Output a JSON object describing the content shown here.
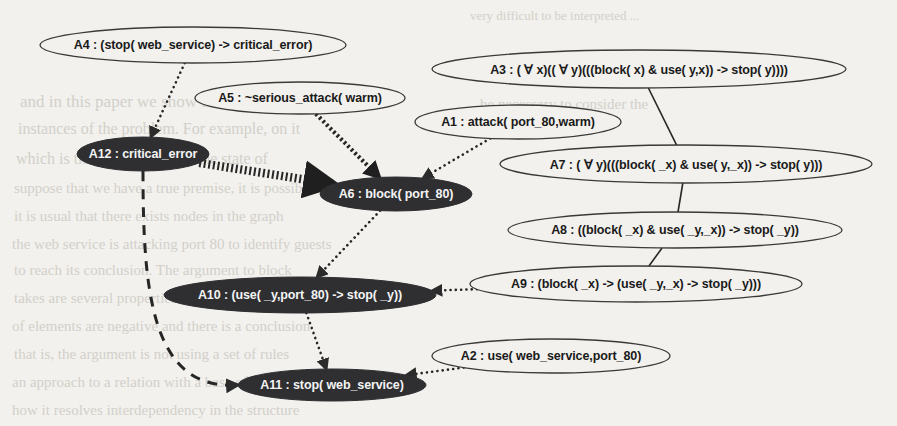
{
  "figure": {
    "kind": "argumentation-graph",
    "background_color": "#f2f1ed",
    "node_fill_light": "#f2f1ed",
    "node_fill_dark": "#2f2f32",
    "node_stroke": "#3a3a3a",
    "label_color_light": "#1a1a1a",
    "label_color_dark": "#f4f4f4"
  },
  "nodes": [
    {
      "id": "A4",
      "label": "A4 : (stop( web_service) -> critical_error)",
      "style": "light",
      "cx": 193,
      "cy": 45,
      "rx": 153,
      "ry": 18,
      "font": 12.5
    },
    {
      "id": "A5",
      "label": "A5 : ~serious_attack( warm)",
      "style": "light",
      "cx": 300,
      "cy": 98,
      "rx": 105,
      "ry": 16,
      "font": 12.5
    },
    {
      "id": "A3",
      "label": "A3 : ( ∀ x)(( ∀ y)(((block( x) & use( y,x)) -> stop( y))))",
      "style": "light",
      "cx": 639,
      "cy": 69,
      "rx": 207,
      "ry": 19,
      "font": 12.5
    },
    {
      "id": "A1",
      "label": "A1 : attack( port_80,warm)",
      "style": "light",
      "cx": 518,
      "cy": 122,
      "rx": 103,
      "ry": 17,
      "font": 12.5
    },
    {
      "id": "A7",
      "label": "A7 : ( ∀ y)(((block( _x) & use( y,_x)) -> stop( y)))",
      "style": "light",
      "cx": 686,
      "cy": 164,
      "rx": 186,
      "ry": 19,
      "font": 12.5
    },
    {
      "id": "A12",
      "label": "A12 : critical_error",
      "style": "dark",
      "cx": 143,
      "cy": 154,
      "rx": 66,
      "ry": 17,
      "font": 12.5
    },
    {
      "id": "A6",
      "label": "A6 : block( port_80)",
      "style": "dark",
      "cx": 396,
      "cy": 194,
      "rx": 76,
      "ry": 17,
      "font": 12.5
    },
    {
      "id": "A8",
      "label": "A8 : ((block( _x) & use( _y,_x)) -> stop( _y))",
      "style": "light",
      "cx": 675,
      "cy": 230,
      "rx": 167,
      "ry": 18,
      "font": 12.5
    },
    {
      "id": "A9",
      "label": "A9 : (block( _x) -> (use( _y,_x) -> stop( _y)))",
      "style": "light",
      "cx": 636,
      "cy": 284,
      "rx": 166,
      "ry": 18,
      "font": 12.5
    },
    {
      "id": "A10",
      "label": "A10 : (use( _y,port_80) -> stop( _y))",
      "style": "dark",
      "cx": 300,
      "cy": 295,
      "rx": 136,
      "ry": 18,
      "font": 12.5
    },
    {
      "id": "A2",
      "label": "A2 : use( web_service,port_80)",
      "style": "light",
      "cx": 551,
      "cy": 356,
      "rx": 119,
      "ry": 17,
      "font": 12.5
    },
    {
      "id": "A11",
      "label": "A11 : stop( web_service)",
      "style": "dark",
      "cx": 332,
      "cy": 385,
      "rx": 94,
      "ry": 16,
      "font": 12.5
    }
  ],
  "edges": [
    {
      "id": "A4-A12",
      "from": "A4",
      "to": "A12",
      "style": "dotted",
      "arrow": true
    },
    {
      "id": "A5-A6",
      "from": "A5",
      "to": "A6",
      "style": "thick-dotted",
      "arrow": true
    },
    {
      "id": "A1-A6",
      "from": "A1",
      "to": "A6",
      "style": "dotted",
      "arrow": true
    },
    {
      "id": "A12-A6",
      "from": "A12",
      "to": "A6",
      "style": "ladder",
      "arrow": true
    },
    {
      "id": "A3-A7",
      "from": "A3",
      "to": "A7",
      "style": "solid",
      "arrow": false
    },
    {
      "id": "A7-A8",
      "from": "A7",
      "to": "A8",
      "style": "solid",
      "arrow": false
    },
    {
      "id": "A8-A9",
      "from": "A8",
      "to": "A9",
      "style": "solid",
      "arrow": false
    },
    {
      "id": "A9-A10",
      "from": "A9",
      "to": "A10",
      "style": "dotted",
      "arrow": true
    },
    {
      "id": "A6-A10",
      "from": "A6",
      "to": "A10",
      "style": "dotted",
      "arrow": true
    },
    {
      "id": "A10-A11",
      "from": "A10",
      "to": "A11",
      "style": "dotted",
      "arrow": true
    },
    {
      "id": "A2-A11",
      "from": "A2",
      "to": "A11",
      "style": "dotted",
      "arrow": true
    },
    {
      "id": "A12-A11",
      "from": "A12",
      "to": "A11",
      "style": "dashed-curve",
      "arrow": true
    }
  ],
  "bleed_text": [
    {
      "text": "very difficult to be interpreted ...",
      "x": 470,
      "y": 8,
      "size": 13
    },
    {
      "text": "and in this paper we show that",
      "x": 20,
      "y": 92,
      "size": 17
    },
    {
      "text": "be necessary to consider the",
      "x": 480,
      "y": 96,
      "size": 15
    },
    {
      "text": "instances of the problem. For example, on it",
      "x": 18,
      "y": 120,
      "size": 16
    },
    {
      "text": "which is the state of A6 and the state of",
      "x": 16,
      "y": 150,
      "size": 16
    },
    {
      "text": "suppose that we have a true premise, it is possible",
      "x": 14,
      "y": 180,
      "size": 15
    },
    {
      "text": "it is usual that there exists nodes in the graph",
      "x": 14,
      "y": 208,
      "size": 15
    },
    {
      "text": "the web service is attacking port 80 to identify guests",
      "x": 12,
      "y": 236,
      "size": 15
    },
    {
      "text": "to reach its conclusion. The argument to block",
      "x": 14,
      "y": 262,
      "size": 15
    },
    {
      "text": "takes are several properties of the same rules",
      "x": 14,
      "y": 290,
      "size": 15
    },
    {
      "text": "of elements are negative and there is a conclusion",
      "x": 12,
      "y": 318,
      "size": 15
    },
    {
      "text": "that is, the argument is not using a set of rules",
      "x": 14,
      "y": 346,
      "size": 15
    },
    {
      "text": "an approach to a relation with a base of premises",
      "x": 12,
      "y": 374,
      "size": 15
    },
    {
      "text": "how it resolves interdependency in the structure",
      "x": 12,
      "y": 402,
      "size": 15
    }
  ]
}
